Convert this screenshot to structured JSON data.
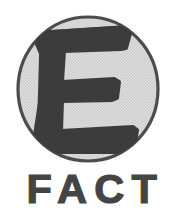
{
  "page": {
    "background_color": "#ffffff",
    "width": 183,
    "height": 211
  },
  "logo": {
    "name": "FACT",
    "wordmark": "FACT",
    "emblem_letter": "E",
    "description": "Bold letter E inside a shaded circle above the word FACT",
    "colors": {
      "ink": "#444444",
      "emblem_letter_fill": "#3c3c3c",
      "circle_fill": "#d7d7d7",
      "circle_fill_shade": "#cfcfcf",
      "circle_outline": "#4a4a4a",
      "background": "#ffffff"
    },
    "circle": {
      "center_x": 88,
      "center_y": 89,
      "radius_x": 71,
      "radius_y": 73,
      "outline_width": 3
    }
  }
}
